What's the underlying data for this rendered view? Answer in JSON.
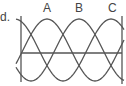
{
  "item_label": "d.",
  "phases": [
    {
      "label": "A",
      "phase_deg": 0
    },
    {
      "label": "B",
      "phase_deg": 120
    },
    {
      "label": "C",
      "phase_deg": 240
    }
  ],
  "colors": {
    "line": "#555555",
    "text": "#444444"
  }
}
